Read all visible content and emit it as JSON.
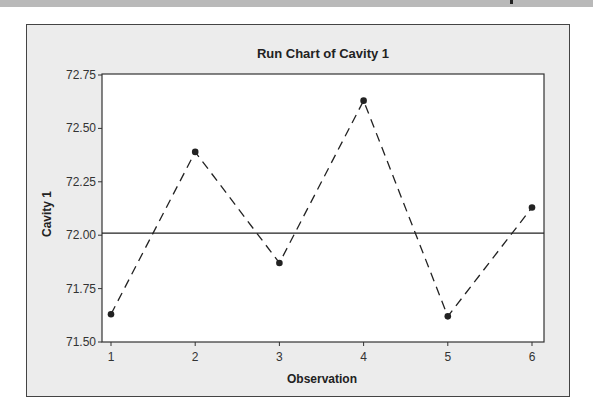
{
  "chart_data": {
    "type": "line",
    "title": "Run Chart of Cavity 1",
    "xlabel": "Observation",
    "ylabel": "Cavity 1",
    "x": [
      1,
      2,
      3,
      4,
      5,
      6
    ],
    "series": [
      {
        "name": "Cavity 1",
        "values": [
          71.63,
          72.39,
          71.87,
          72.63,
          71.62,
          72.13
        ],
        "style": "dashed",
        "marker": "circle"
      }
    ],
    "reference_lines": [
      {
        "name": "center-line",
        "value": 72.01,
        "style": "solid"
      }
    ],
    "xticks": [
      "1",
      "2",
      "3",
      "4",
      "5",
      "6"
    ],
    "yticks": [
      "71.50",
      "71.75",
      "72.00",
      "72.25",
      "72.50",
      "72.75"
    ],
    "ylim": [
      71.5,
      72.75
    ],
    "xlim": [
      0.85,
      6.15
    ],
    "grid": false,
    "legend": "none"
  },
  "colors": {
    "line": "#222222",
    "plot_bg": "#ffffff",
    "frame_bg": "#ececec",
    "band": "#b9b9b9"
  }
}
